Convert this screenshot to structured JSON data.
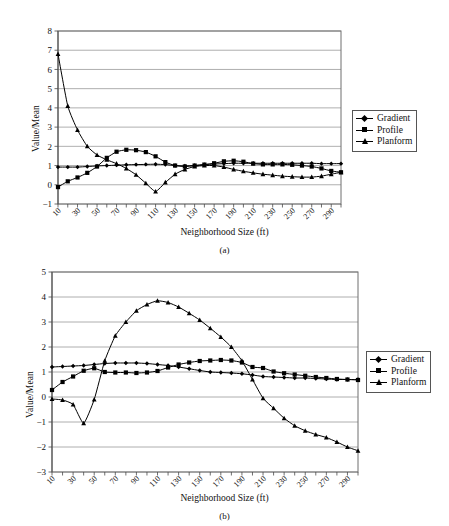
{
  "figure": {
    "panels": [
      {
        "id": "a",
        "caption": "(a)",
        "ylabel": "Value/Mean",
        "xlabel": "Neighborhood Size (ft)"
      },
      {
        "id": "b",
        "caption": "(b)",
        "ylabel": "Value/Mean",
        "xlabel": "Neighborhood Size (ft)"
      }
    ],
    "legend": {
      "items": [
        {
          "label": "Gradient",
          "marker": "diamond"
        },
        {
          "label": "Profile",
          "marker": "square"
        },
        {
          "label": "Planform",
          "marker": "triangle"
        }
      ]
    }
  },
  "chart_data": [
    {
      "type": "line",
      "panel": "a",
      "title": "(a)",
      "xlabel": "Neighborhood Size (ft)",
      "ylabel": "Value/Mean",
      "xlim": [
        10,
        300
      ],
      "ylim": [
        -1,
        8
      ],
      "yticks": [
        -1,
        0,
        1,
        2,
        3,
        4,
        5,
        6,
        7,
        8
      ],
      "xticks": [
        10,
        30,
        50,
        70,
        90,
        110,
        130,
        150,
        170,
        190,
        210,
        230,
        250,
        270,
        290
      ],
      "xtick_step": 10,
      "grid": "horizontal",
      "legend_position": "right",
      "x": [
        10,
        20,
        30,
        40,
        50,
        60,
        70,
        80,
        90,
        100,
        110,
        120,
        130,
        140,
        150,
        160,
        170,
        180,
        190,
        200,
        210,
        220,
        230,
        240,
        250,
        260,
        270,
        280,
        290,
        300
      ],
      "series": [
        {
          "name": "Gradient",
          "marker": "diamond",
          "values": [
            0.92,
            0.92,
            0.92,
            0.95,
            0.98,
            1.0,
            1.02,
            1.04,
            1.05,
            1.06,
            1.07,
            1.05,
            1.0,
            0.98,
            1.0,
            1.05,
            1.08,
            1.1,
            1.12,
            1.12,
            1.12,
            1.12,
            1.12,
            1.12,
            1.12,
            1.12,
            1.12,
            1.1,
            1.1,
            1.1
          ]
        },
        {
          "name": "Profile",
          "marker": "square",
          "values": [
            -0.12,
            0.18,
            0.38,
            0.62,
            0.95,
            1.4,
            1.72,
            1.82,
            1.8,
            1.7,
            1.48,
            1.18,
            1.0,
            0.95,
            1.0,
            1.05,
            1.12,
            1.22,
            1.25,
            1.2,
            1.1,
            1.06,
            1.06,
            1.06,
            1.04,
            1.0,
            0.95,
            0.85,
            0.72,
            0.65
          ]
        },
        {
          "name": "Planform",
          "marker": "triangle",
          "values": [
            6.8,
            4.1,
            2.85,
            2.0,
            1.55,
            1.3,
            1.1,
            0.85,
            0.52,
            0.08,
            -0.35,
            0.12,
            0.55,
            0.8,
            0.95,
            1.0,
            1.0,
            0.92,
            0.8,
            0.7,
            0.62,
            0.55,
            0.5,
            0.45,
            0.42,
            0.4,
            0.4,
            0.45,
            0.55,
            0.65
          ]
        }
      ]
    },
    {
      "type": "line",
      "panel": "b",
      "title": "(b)",
      "xlabel": "Neighborhood Size (ft)",
      "ylabel": "Value/Mean",
      "xlim": [
        10,
        300
      ],
      "ylim": [
        -3,
        5
      ],
      "yticks": [
        -3,
        -2,
        -1,
        0,
        1,
        2,
        3,
        4,
        5
      ],
      "xticks": [
        10,
        30,
        50,
        70,
        90,
        110,
        130,
        150,
        170,
        190,
        210,
        230,
        250,
        270,
        290
      ],
      "xtick_step": 10,
      "grid": "horizontal",
      "legend_position": "right",
      "x": [
        10,
        20,
        30,
        40,
        50,
        60,
        70,
        80,
        90,
        100,
        110,
        120,
        130,
        140,
        150,
        160,
        170,
        180,
        190,
        200,
        210,
        220,
        230,
        240,
        250,
        260,
        270,
        280,
        290,
        300
      ],
      "series": [
        {
          "name": "Gradient",
          "marker": "diamond",
          "values": [
            1.2,
            1.22,
            1.24,
            1.26,
            1.3,
            1.34,
            1.36,
            1.36,
            1.36,
            1.34,
            1.3,
            1.26,
            1.2,
            1.13,
            1.06,
            1.0,
            0.98,
            0.96,
            0.93,
            0.88,
            0.82,
            0.8,
            0.78,
            0.76,
            0.76,
            0.74,
            0.72,
            0.7,
            0.7,
            0.7
          ]
        },
        {
          "name": "Profile",
          "marker": "square",
          "values": [
            0.28,
            0.6,
            0.82,
            1.05,
            1.15,
            1.0,
            0.98,
            0.98,
            0.96,
            0.98,
            1.04,
            1.18,
            1.3,
            1.38,
            1.44,
            1.46,
            1.48,
            1.46,
            1.38,
            1.2,
            1.16,
            1.02,
            0.95,
            0.9,
            0.85,
            0.8,
            0.76,
            0.72,
            0.7,
            0.68
          ]
        },
        {
          "name": "Planform",
          "marker": "triangle",
          "values": [
            -0.08,
            -0.12,
            -0.3,
            -1.05,
            -0.1,
            1.45,
            2.45,
            3.0,
            3.45,
            3.7,
            3.85,
            3.78,
            3.6,
            3.35,
            3.08,
            2.75,
            2.4,
            2.0,
            1.45,
            0.7,
            -0.05,
            -0.45,
            -0.85,
            -1.15,
            -1.35,
            -1.5,
            -1.62,
            -1.8,
            -2.0,
            -2.15
          ]
        }
      ]
    }
  ]
}
